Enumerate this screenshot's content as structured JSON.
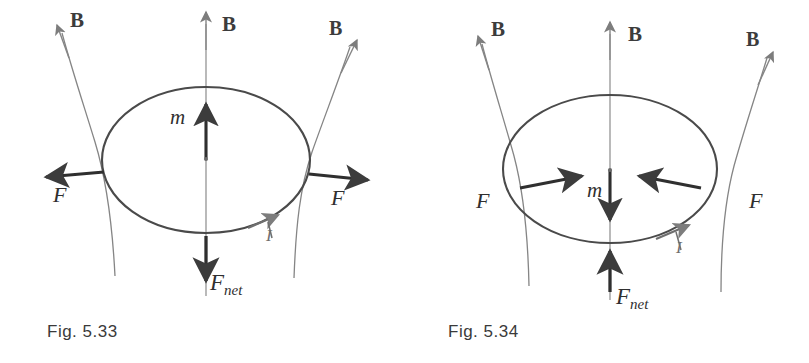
{
  "sheet": {
    "background_color": "#ffffff",
    "ink_dark": "#3a3a3a",
    "ink_mid": "#6f6f6f",
    "ink_light": "#8c8c8c"
  },
  "figures": [
    {
      "id": "fig-5-33",
      "caption": "Fig. 5.33",
      "description_labels": {
        "b_left": "B",
        "b_center": "B",
        "b_right": "B",
        "f_left": "F",
        "f_right": "F",
        "moment": "m",
        "f_net": "F",
        "f_net_sub": "net",
        "current": "I"
      },
      "geometry": {
        "loop_center_x": 206,
        "loop_center_y": 160,
        "loop_rx": 104,
        "loop_ry": 73,
        "axis_x": 206,
        "axis_top_y": 12,
        "axis_bottom_y": 296,
        "moment_tail_y": 158,
        "moment_tip_y": 101,
        "f_net_tail_y": 236,
        "f_net_tip_y": 284,
        "f_left_tip_x": 42,
        "f_right_tip_x": 372,
        "f_arrow_y": 177,
        "current_marker_x": 268,
        "current_marker_y": 219
      }
    },
    {
      "id": "fig-5-34",
      "caption": "Fig. 5.34",
      "description_labels": {
        "b_left": "B",
        "b_center": "B",
        "b_right": "B",
        "f_left": "F",
        "f_right": "F",
        "moment": "m",
        "f_net": "F",
        "f_net_sub": "net",
        "current": "I"
      },
      "geometry": {
        "loop_center_x": 206,
        "loop_center_y": 169,
        "loop_rx": 107,
        "loop_ry": 74,
        "axis_x": 206,
        "axis_top_y": 22,
        "axis_bottom_y": 300,
        "moment_tail_y": 170,
        "moment_tip_y": 223,
        "f_net_tail_y": 292,
        "f_net_tip_y": 248,
        "f_left_start_x": 117,
        "f_left_tip_x": 180,
        "f_right_start_x": 296,
        "f_right_tip_x": 232,
        "f_arrow_y": 182,
        "current_marker_x": 275,
        "current_marker_y": 228
      }
    }
  ]
}
